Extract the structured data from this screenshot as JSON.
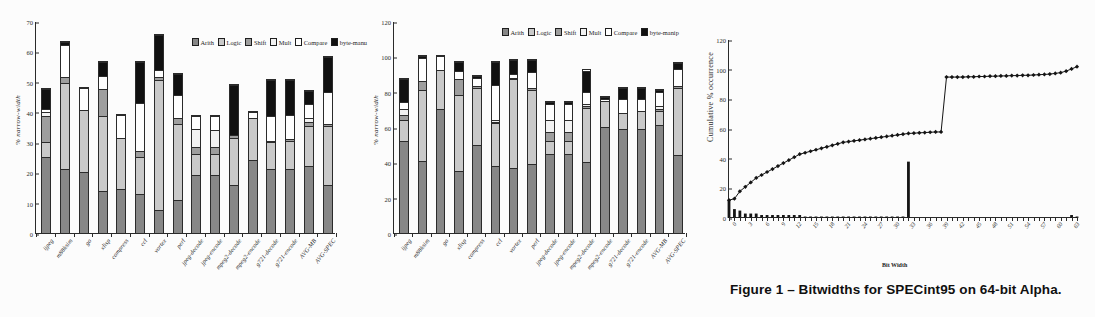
{
  "figure": {
    "caption": "Figure 1 – Bitwidths for SPECint95 on 64-bit Alpha."
  },
  "legend": {
    "items": [
      {
        "key": "arith",
        "label": "Arith",
        "color": "#878787"
      },
      {
        "key": "logic",
        "label": "Logic",
        "color": "#c9c9c9"
      },
      {
        "key": "shift",
        "label": "Shift",
        "color": "#9e9e9e"
      },
      {
        "key": "mult",
        "label": "Mult",
        "color": "#f2f2f2"
      },
      {
        "key": "compare",
        "label": "Compare",
        "color": "#ffffff"
      },
      {
        "key": "byte",
        "label": "byte-manu",
        "color": "#111111"
      }
    ],
    "items_b": [
      {
        "key": "arith",
        "label": "Arith",
        "color": "#878787"
      },
      {
        "key": "logic",
        "label": "Logic",
        "color": "#c9c9c9"
      },
      {
        "key": "shift",
        "label": "Shift",
        "color": "#9e9e9e"
      },
      {
        "key": "mult",
        "label": "Mult",
        "color": "#f2f2f2"
      },
      {
        "key": "compare",
        "label": "Compare",
        "color": "#ffffff"
      },
      {
        "key": "byte",
        "label": "byte-manip",
        "color": "#111111"
      }
    ]
  },
  "chart_data": [
    {
      "id": "chart-a",
      "type": "bar",
      "stacked": true,
      "title": "",
      "xlabel": "",
      "ylabel": "% narrow-width",
      "ylim": [
        0,
        70
      ],
      "yticks": [
        0,
        10,
        20,
        30,
        40,
        50,
        60,
        70
      ],
      "grid": false,
      "legend_position": "top-right",
      "categories": [
        "ijpeg",
        "m88ksim",
        "go",
        "xlisp",
        "compress",
        "ccl",
        "vortex",
        "perl",
        "jpeg-decode",
        "jpeg-encode",
        "mpeg2-decode",
        "mpeg2-encode",
        "g721-decode",
        "g721-encode",
        "AVG-MB",
        "AVG-SPEC"
      ],
      "series": [
        {
          "name": "Arith",
          "values": [
            25.0,
            21.0,
            20.0,
            14.0,
            14.5,
            13.0,
            7.5,
            11.0,
            19.0,
            19.0,
            16.0,
            24.0,
            21.0,
            21.0,
            22.0,
            16.0
          ]
        },
        {
          "name": "Logic",
          "values": [
            5.0,
            28.5,
            20.5,
            24.5,
            17.0,
            12.0,
            43.0,
            25.0,
            7.0,
            7.0,
            15.5,
            14.0,
            9.0,
            9.5,
            13.5,
            19.5
          ]
        },
        {
          "name": "Shift",
          "values": [
            8.5,
            2.0,
            0.0,
            9.0,
            0.0,
            2.0,
            1.0,
            2.0,
            2.5,
            2.5,
            1.0,
            0.0,
            0.5,
            0.5,
            1.0,
            0.5
          ]
        },
        {
          "name": "Mult",
          "values": [
            1.5,
            0.0,
            0.0,
            0.0,
            0.0,
            0.0,
            0.0,
            0.0,
            6.0,
            5.5,
            0.0,
            0.0,
            0.0,
            0.0,
            1.5,
            0.0
          ]
        },
        {
          "name": "Compare",
          "values": [
            1.0,
            10.5,
            7.5,
            4.5,
            7.5,
            16.0,
            2.5,
            7.5,
            4.0,
            4.5,
            0.0,
            2.0,
            8.0,
            8.0,
            4.5,
            10.5
          ]
        },
        {
          "name": "byte-manu",
          "values": [
            6.5,
            1.0,
            0.0,
            4.5,
            0.0,
            13.5,
            11.5,
            7.0,
            0.0,
            0.0,
            16.5,
            0.0,
            12.0,
            11.5,
            4.5,
            11.5
          ]
        }
      ]
    },
    {
      "id": "chart-b",
      "type": "bar",
      "stacked": true,
      "title": "",
      "xlabel": "",
      "ylabel": "% narrow-width",
      "ylim": [
        0,
        120
      ],
      "yticks": [
        0,
        20,
        40,
        60,
        80,
        100,
        120
      ],
      "grid": false,
      "legend_position": "top-right",
      "categories": [
        "ijpeg",
        "m88ksim",
        "go",
        "xlisp",
        "compress",
        "ccl",
        "vortex",
        "perl",
        "jpeg-decode",
        "jpeg-encode",
        "mpeg2-decode",
        "mpeg2-encode",
        "g721-decode",
        "g721-encode",
        "AVG-MB",
        "AVG-SPEC"
      ],
      "series": [
        {
          "name": "Arith",
          "values": [
            52.0,
            41.0,
            70.0,
            35.0,
            50.0,
            38.0,
            37.0,
            39.0,
            45.0,
            45.0,
            40.0,
            60.0,
            59.0,
            59.0,
            61.0,
            44.0
          ]
        },
        {
          "name": "Logic",
          "values": [
            12.0,
            40.0,
            22.0,
            43.0,
            32.0,
            24.0,
            50.0,
            42.0,
            7.0,
            7.0,
            31.0,
            15.0,
            9.0,
            10.0,
            8.0,
            38.0
          ]
        },
        {
          "name": "Shift",
          "values": [
            3.0,
            5.0,
            0.0,
            9.0,
            1.0,
            1.0,
            1.0,
            1.0,
            5.0,
            5.0,
            1.0,
            0.0,
            0.0,
            0.0,
            1.0,
            1.0
          ]
        },
        {
          "name": "Mult",
          "values": [
            3.0,
            0.0,
            0.0,
            0.0,
            0.0,
            1.0,
            0.0,
            0.0,
            7.0,
            7.0,
            1.0,
            0.0,
            0.0,
            0.0,
            2.0,
            0.0
          ]
        },
        {
          "name": "Compare",
          "values": [
            4.0,
            13.0,
            8.0,
            5.0,
            5.0,
            20.0,
            2.0,
            9.0,
            9.0,
            9.0,
            7.0,
            1.0,
            8.0,
            7.0,
            8.0,
            10.0
          ]
        },
        {
          "name": "byte-manip",
          "values": [
            13.0,
            1.0,
            0.0,
            5.0,
            1.0,
            13.0,
            8.0,
            7.0,
            1.0,
            1.0,
            12.0,
            1.0,
            6.0,
            6.0,
            1.0,
            3.0
          ]
        }
      ]
    },
    {
      "id": "chart-c",
      "type": "line",
      "title": "",
      "xlabel": "Bit Width",
      "ylabel": "Cumulative % occurrence",
      "ylim": [
        0,
        120
      ],
      "yticks": [
        0,
        20,
        40,
        60,
        80,
        100,
        120
      ],
      "xlim": [
        0,
        64
      ],
      "xticks": [
        0,
        3,
        6,
        9,
        12,
        15,
        18,
        21,
        24,
        27,
        30,
        33,
        36,
        39,
        42,
        45,
        48,
        51,
        54,
        57,
        60,
        63
      ],
      "grid": false,
      "legend_position": "none",
      "series": [
        {
          "name": "Cumulative % occurrence",
          "marker": "diamond",
          "x": [
            0,
            1,
            2,
            3,
            4,
            5,
            6,
            7,
            8,
            9,
            10,
            11,
            12,
            13,
            14,
            15,
            16,
            17,
            18,
            19,
            20,
            21,
            22,
            23,
            24,
            25,
            26,
            27,
            28,
            29,
            30,
            31,
            32,
            33,
            34,
            35,
            36,
            37,
            38,
            39,
            40,
            41,
            42,
            43,
            44,
            45,
            46,
            47,
            48,
            49,
            50,
            51,
            52,
            53,
            54,
            55,
            56,
            57,
            58,
            59,
            60,
            61,
            62,
            63,
            64
          ],
          "values": [
            12,
            13,
            18,
            21,
            24,
            27,
            29,
            31,
            33,
            35,
            37,
            39,
            41,
            43,
            44,
            45,
            46,
            47,
            48,
            49,
            50,
            51,
            51.5,
            52,
            52.5,
            53,
            53.5,
            54,
            54.5,
            55,
            55.5,
            56,
            56.5,
            57,
            57.2,
            57.4,
            57.6,
            57.8,
            58,
            58,
            95,
            95,
            95,
            95,
            95.2,
            95.2,
            95.4,
            95.4,
            95.6,
            95.6,
            95.8,
            95.8,
            96,
            96,
            96.2,
            96.2,
            96.4,
            96.6,
            96.8,
            97,
            97.5,
            98,
            99,
            100.5,
            102
          ]
        },
        {
          "name": "occurrence histogram",
          "marker": "bar",
          "x": [
            0,
            1,
            2,
            3,
            4,
            5,
            6,
            7,
            8,
            9,
            10,
            11,
            12,
            13,
            14,
            15,
            16,
            17,
            18,
            19,
            20,
            21,
            22,
            23,
            24,
            25,
            26,
            27,
            28,
            29,
            30,
            31,
            32,
            33,
            34,
            35,
            36,
            37,
            38,
            39,
            40,
            41,
            42,
            43,
            44,
            45,
            46,
            47,
            48,
            49,
            50,
            51,
            52,
            53,
            54,
            55,
            56,
            57,
            58,
            59,
            60,
            61,
            62,
            63,
            64
          ],
          "values": [
            12,
            6,
            5,
            3,
            3,
            3,
            2,
            2,
            2,
            2,
            2,
            2,
            2,
            2,
            1,
            1,
            1,
            1,
            1,
            1,
            1,
            1,
            1,
            1,
            1,
            1,
            1,
            1,
            1,
            1,
            1,
            1,
            1,
            38,
            0,
            0,
            0,
            0,
            0,
            0,
            0,
            0,
            0,
            0,
            0,
            0,
            0,
            0,
            0,
            0,
            0,
            0,
            0,
            0,
            0,
            0,
            0,
            0,
            0,
            0,
            0,
            0,
            0,
            2,
            1
          ]
        }
      ]
    }
  ]
}
